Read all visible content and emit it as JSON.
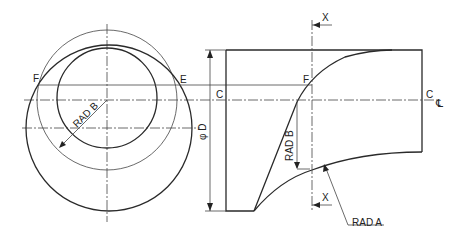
{
  "diagram": {
    "type": "engineering-drawing",
    "left_view": {
      "labels": {
        "point_f": "F",
        "point_e": "E",
        "radius_b": "RAD B"
      }
    },
    "right_view": {
      "labels": {
        "point_c_left": "C",
        "point_c_right": "C",
        "point_f": "F",
        "diameter": "φ D",
        "radius_b": "RAD B",
        "radius_a": "RAD A",
        "section_top": "X",
        "section_bottom": "X",
        "centerline_symbol": "℄"
      }
    }
  }
}
